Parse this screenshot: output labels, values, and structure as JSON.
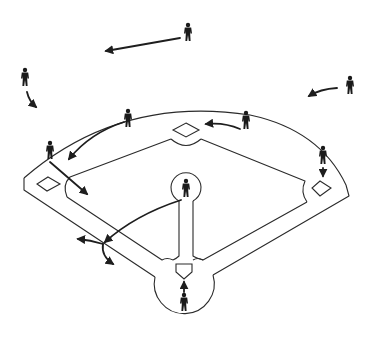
{
  "diagram": {
    "title": "",
    "background": "#ffffff",
    "line_color": "#2a2a2a",
    "player_color": "#1a1a1a",
    "players": [
      {
        "id": "player-1",
        "role": "deep-outfielder-center",
        "x": 188,
        "y": 32
      },
      {
        "id": "player-2",
        "role": "left-fielder",
        "x": 25,
        "y": 77
      },
      {
        "id": "player-3",
        "role": "right-fielder",
        "x": 350,
        "y": 85
      },
      {
        "id": "player-4",
        "role": "shortstop",
        "x": 128,
        "y": 118
      },
      {
        "id": "player-5",
        "role": "second-baseman",
        "x": 246,
        "y": 120
      },
      {
        "id": "player-6",
        "role": "third-baseman",
        "x": 50,
        "y": 150
      },
      {
        "id": "player-7",
        "role": "first-baseman",
        "x": 323,
        "y": 155
      },
      {
        "id": "player-8",
        "role": "pitcher",
        "x": 186,
        "y": 188
      },
      {
        "id": "player-9",
        "role": "catcher",
        "x": 184,
        "y": 302
      }
    ],
    "arrows": [
      {
        "id": "arrow-center-to-left",
        "path": "M180 38 L106 51"
      },
      {
        "id": "arrow-right-fielder",
        "path": "M337 88 Q320 89 309 96"
      },
      {
        "id": "arrow-left-fielder",
        "path": "M27 92 Q29 101 36 107"
      },
      {
        "id": "arrow-shortstop",
        "path": "M124 122 Q90 133 69 159"
      },
      {
        "id": "arrow-second-baseman",
        "path": "M240 129 Q224 122 206 124"
      },
      {
        "id": "arrow-third-baseman",
        "path": "M50 162 L87 194"
      },
      {
        "id": "arrow-first-baseman",
        "path": "M323 168 L323 176"
      },
      {
        "id": "arrow-pitcher-throw",
        "path": "M181 200 Q135 215 105 242"
      },
      {
        "id": "arrow-throw-branch-left",
        "path": "M103 244 Q90 240 78 239"
      },
      {
        "id": "arrow-throw-branch-down",
        "path": "M103 244 Q101 256 113 264"
      },
      {
        "id": "arrow-catcher",
        "path": "M184 292 L184 282"
      }
    ],
    "bases": [
      {
        "id": "second-base",
        "x": 186,
        "y": 130
      },
      {
        "id": "third-base",
        "x": 46,
        "y": 184
      },
      {
        "id": "first-base",
        "x": 321,
        "y": 188
      }
    ]
  }
}
